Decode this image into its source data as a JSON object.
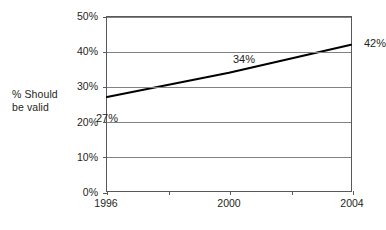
{
  "chart_data": {
    "type": "line",
    "title": "",
    "subtitle": "",
    "xlabel": "",
    "ylabel": "% Should be valid",
    "x": [
      1996,
      2000,
      2004
    ],
    "categories": [
      "1996",
      "2000",
      "2004"
    ],
    "values": [
      27,
      34,
      42
    ],
    "series": [
      {
        "name": "% Should be valid",
        "values": [
          27,
          34,
          42
        ]
      }
    ],
    "point_labels": [
      "27%",
      "34%",
      "42%"
    ],
    "xlim": [
      1996,
      2004
    ],
    "ylim": [
      0,
      50
    ],
    "ytick_values": [
      0,
      10,
      20,
      30,
      40,
      50
    ],
    "ytick_labels": [
      "0%",
      "10%",
      "20%",
      "30%",
      "40%",
      "50%"
    ],
    "xtick_values": [
      1996,
      1998,
      2000,
      2002,
      2004
    ],
    "xtick_labels": [
      "1996",
      "",
      "2000",
      "",
      "2004"
    ],
    "grid": true,
    "grid_axis": "y",
    "legend": false,
    "legend_position": "none",
    "line_color": "#000000",
    "grid_color": "#808285",
    "frame_color": "#58595b",
    "text_color": "#231f20",
    "background_color": "#ffffff"
  },
  "axis_title": {
    "line1": "% Should",
    "line2": "be valid"
  }
}
